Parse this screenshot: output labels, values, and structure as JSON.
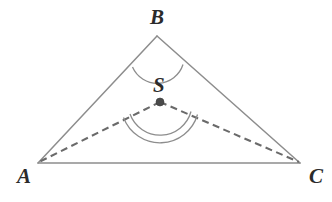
{
  "figure": {
    "canvas": {
      "width": 332,
      "height": 202,
      "background": "#ffffff"
    },
    "colors": {
      "side_stroke": "#8d8d8d",
      "dashed_stroke": "#6a6a6a",
      "arc_stroke": "#8d8d8d",
      "label_fill": "#2b2b2b",
      "point_fill": "#4a4a4a"
    },
    "points": [
      {
        "name": "A",
        "label": "A",
        "x": 38,
        "y": 163,
        "label_x": 17,
        "label_y": 183,
        "marked": false
      },
      {
        "name": "B",
        "label": "B",
        "x": 157,
        "y": 36,
        "label_x": 150,
        "label_y": 24,
        "marked": false
      },
      {
        "name": "C",
        "label": "C",
        "x": 300,
        "y": 163,
        "label_x": 309,
        "label_y": 183,
        "marked": false
      },
      {
        "name": "S",
        "label": "S",
        "x": 160,
        "y": 102,
        "label_x": 153,
        "label_y": 92,
        "marked": true
      }
    ],
    "segments": [
      {
        "name": "side-AB",
        "from": "A",
        "to": "B",
        "style": "solid"
      },
      {
        "name": "side-BC",
        "from": "B",
        "to": "C",
        "style": "solid"
      },
      {
        "name": "side-AC",
        "from": "A",
        "to": "C",
        "style": "solid"
      },
      {
        "name": "cevian-SA",
        "from": "S",
        "to": "A",
        "style": "dashed"
      },
      {
        "name": "cevian-SC",
        "from": "S",
        "to": "C",
        "style": "dashed"
      }
    ],
    "angle_marks": [
      {
        "name": "angle-at-B",
        "vertex": "B",
        "arcs": 1,
        "radius": 28,
        "path": "M 130.5 65.5 A 28 28 0 0 0 184.5 63.5"
      },
      {
        "name": "angle-at-S",
        "vertex": "S",
        "arcs": 2,
        "radius": 34,
        "path": "M 128.6 113.5 A 34 34 0 0 0 193.6 111.0"
      },
      {
        "name": "angle-at-S-outer",
        "vertex": "S",
        "arcs": 2,
        "radius": 40,
        "path": "M 122.8 117.0 A 40 40 0 0 0 199.2 114.0"
      }
    ]
  }
}
